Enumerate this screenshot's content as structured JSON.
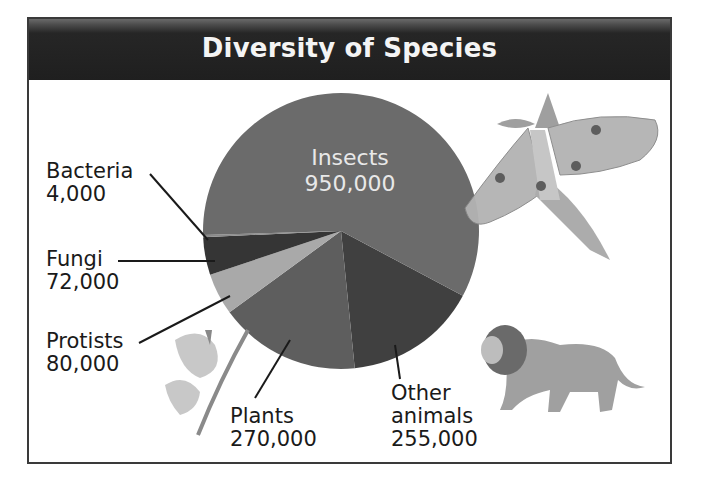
{
  "title": "Diversity of Species",
  "chart_data": {
    "type": "pie",
    "title": "Diversity of Species",
    "categories": [
      "Insects",
      "Other animals",
      "Plants",
      "Protists",
      "Fungi",
      "Bacteria"
    ],
    "values": [
      950000,
      255000,
      270000,
      80000,
      72000,
      4000
    ],
    "labels": {
      "insects": {
        "name": "Insects",
        "value": "950,000"
      },
      "other_animals": {
        "name_line1": "Other",
        "name_line2": "animals",
        "value": "255,000"
      },
      "plants": {
        "name": "Plants",
        "value": "270,000"
      },
      "protists": {
        "name": "Protists",
        "value": "80,000"
      },
      "fungi": {
        "name": "Fungi",
        "value": "72,000"
      },
      "bacteria": {
        "name": "Bacteria",
        "value": "4,000"
      }
    },
    "colors": {
      "insects": "#6b6b6b",
      "other_animals": "#404040",
      "plants": "#5e5e5e",
      "protists": "#a9a9a9",
      "fungi": "#353535",
      "bacteria": "#8a8a8a"
    },
    "illustrations": [
      "moth-icon",
      "lion-icon",
      "flower-icon"
    ]
  }
}
